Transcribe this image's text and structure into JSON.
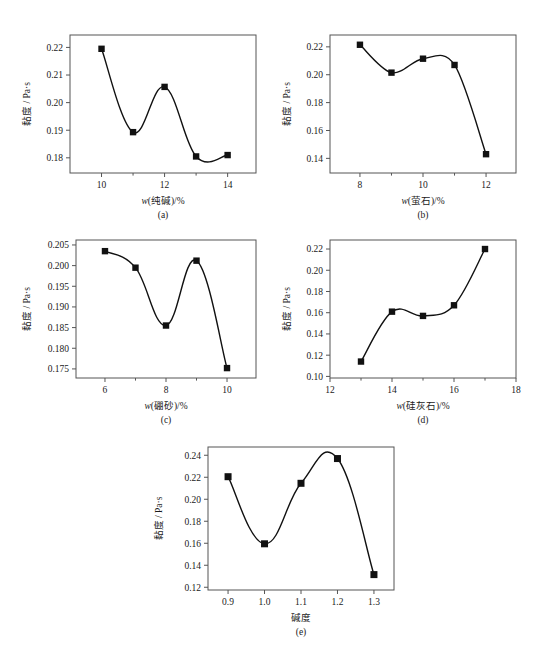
{
  "figure": {
    "ylabel": "黏度 / Pa·s",
    "marker_shape": "filled-square",
    "curve_color": "#111111",
    "frame_color": "#555555"
  },
  "chart_data": [
    {
      "type": "scatter",
      "panel": "a",
      "caption": "(a)",
      "title": "",
      "xlabel": "w(纯碱)/%",
      "ylabel": "黏度 / Pa·s",
      "xlabel_italic_prefix": "w",
      "xlabel_rest": "(纯碱)/%",
      "x": [
        10,
        11,
        12,
        13,
        14
      ],
      "values": [
        0.2195,
        0.1893,
        0.2057,
        0.1805,
        0.181
      ],
      "xlim": [
        9.0,
        14.9
      ],
      "ylim": [
        0.1745,
        0.2245
      ],
      "xticks": [
        10,
        12,
        14
      ],
      "xticks_minor": [
        11,
        13
      ],
      "yticks": [
        0.18,
        0.19,
        0.2,
        0.21,
        0.22
      ],
      "ytick_labels": [
        "0.18",
        "0.19",
        "0.20",
        "0.21",
        "0.22"
      ],
      "grid": false,
      "legend": "none",
      "fit": "smooth-spline"
    },
    {
      "type": "scatter",
      "panel": "b",
      "caption": "(b)",
      "title": "",
      "xlabel": "w(萤石)/%",
      "ylabel": "黏度 / Pa·s",
      "xlabel_italic_prefix": "w",
      "xlabel_rest": "(萤石)/%",
      "x": [
        8,
        9,
        10,
        11,
        12
      ],
      "values": [
        0.2215,
        0.2015,
        0.2115,
        0.207,
        0.143
      ],
      "xlim": [
        7.05,
        12.95
      ],
      "ylim": [
        0.1295,
        0.2285
      ],
      "xticks": [
        8,
        10,
        12
      ],
      "xticks_minor": [
        9,
        11
      ],
      "yticks": [
        0.14,
        0.16,
        0.18,
        0.2,
        0.22
      ],
      "ytick_labels": [
        "0.14",
        "0.16",
        "0.18",
        "0.20",
        "0.22"
      ],
      "grid": false,
      "legend": "none",
      "fit": "smooth-spline"
    },
    {
      "type": "scatter",
      "panel": "c",
      "caption": "(c)",
      "title": "",
      "xlabel": "w(硼砂)/%",
      "ylabel": "黏度 / Pa·s",
      "xlabel_italic_prefix": "w",
      "xlabel_rest": "(硼砂)/%",
      "x": [
        6,
        7,
        8,
        9,
        10
      ],
      "values": [
        0.2035,
        0.1995,
        0.1855,
        0.2012,
        0.1752
      ],
      "xlim": [
        5.05,
        10.95
      ],
      "ylim": [
        0.1728,
        0.2062
      ],
      "xticks": [
        6,
        8,
        10
      ],
      "xticks_minor": [
        7,
        9
      ],
      "yticks": [
        0.175,
        0.18,
        0.185,
        0.19,
        0.195,
        0.2,
        0.205
      ],
      "ytick_labels": [
        "0.175",
        "0.180",
        "0.185",
        "0.190",
        "0.195",
        "0.200",
        "0.205"
      ],
      "grid": false,
      "legend": "none",
      "fit": "smooth-spline"
    },
    {
      "type": "scatter",
      "panel": "d",
      "caption": "(d)",
      "title": "",
      "xlabel": "w(硅灰石)/%",
      "ylabel": "黏度 / Pa·s",
      "xlabel_italic_prefix": "w",
      "xlabel_rest": "(硅灰石)/%",
      "x": [
        13,
        14,
        15,
        16,
        17
      ],
      "values": [
        0.114,
        0.161,
        0.157,
        0.167,
        0.22
      ],
      "xlim": [
        12.0,
        18.0
      ],
      "ylim": [
        0.0985,
        0.2285
      ],
      "xticks": [
        12,
        14,
        16,
        18
      ],
      "xticks_minor": [
        13,
        15,
        17
      ],
      "yticks": [
        0.1,
        0.12,
        0.14,
        0.16,
        0.18,
        0.2,
        0.22
      ],
      "ytick_labels": [
        "0.10",
        "0.12",
        "0.14",
        "0.16",
        "0.18",
        "0.20",
        "0.22"
      ],
      "grid": false,
      "legend": "none",
      "fit": "smooth-spline"
    },
    {
      "type": "scatter",
      "panel": "e",
      "caption": "(e)",
      "title": "",
      "xlabel": "碱度",
      "ylabel": "黏度 / Pa·s",
      "xlabel_italic_prefix": "",
      "xlabel_rest": "碱度",
      "x": [
        0.9,
        1.0,
        1.1,
        1.2,
        1.3
      ],
      "values": [
        0.2205,
        0.1595,
        0.2145,
        0.237,
        0.1315
      ],
      "xlim": [
        0.845,
        1.355
      ],
      "ylim": [
        0.1175,
        0.2475
      ],
      "xticks": [
        0.9,
        1.0,
        1.1,
        1.2,
        1.3
      ],
      "xticks_minor": [],
      "yticks": [
        0.12,
        0.14,
        0.16,
        0.18,
        0.2,
        0.22,
        0.24
      ],
      "ytick_labels": [
        "0.12",
        "0.14",
        "0.16",
        "0.18",
        "0.20",
        "0.22",
        "0.24"
      ],
      "grid": false,
      "legend": "none",
      "fit": "smooth-spline"
    }
  ]
}
